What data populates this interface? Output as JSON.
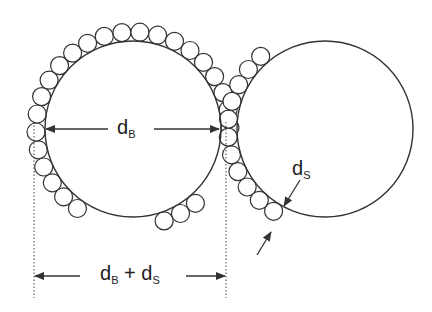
{
  "diagram": {
    "colors": {
      "stroke": "#333333",
      "background": "#ffffff"
    },
    "left_sphere": {
      "cx": 133,
      "cy": 129,
      "r": 88
    },
    "right_sphere": {
      "cx": 325,
      "cy": 129,
      "r": 88
    },
    "small_particle_radius": 9,
    "labels": {
      "dB": {
        "base": "d",
        "sub": "B"
      },
      "dS": {
        "base": "d",
        "sub": "S"
      },
      "dB_plus_dS": {
        "base1": "d",
        "sub1": "B",
        "op": " + ",
        "base2": "d",
        "sub2": "S"
      }
    }
  }
}
